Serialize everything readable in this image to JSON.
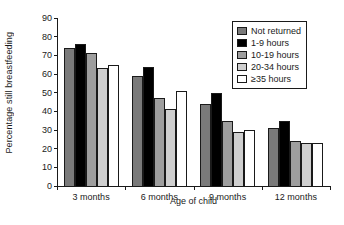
{
  "chart_data": {
    "type": "bar",
    "title": "",
    "xlabel": "Age of child",
    "ylabel": "Percentage still breastfeeding",
    "categories": [
      "3 months",
      "6 months",
      "9 months",
      "12 months"
    ],
    "ylim": [
      0,
      90
    ],
    "yticks": [
      0,
      10,
      20,
      30,
      40,
      50,
      60,
      70,
      80,
      90
    ],
    "grid": false,
    "legend_position": "top-right",
    "series": [
      {
        "name": "Not returned",
        "color": "#7a7a7a",
        "values": [
          74,
          59,
          44,
          31
        ]
      },
      {
        "name": "1-9 hours",
        "color": "#000000",
        "values": [
          76,
          64,
          50,
          35
        ]
      },
      {
        "name": "10-19 hours",
        "color": "#9e9e9e",
        "values": [
          71,
          47,
          35,
          24
        ]
      },
      {
        "name": "20-34 hours",
        "color": "#cfcfcf",
        "values": [
          63,
          41,
          29,
          23
        ]
      },
      {
        "name": "≥35 hours",
        "color": "#ffffff",
        "values": [
          65,
          51,
          30,
          23
        ]
      }
    ]
  }
}
